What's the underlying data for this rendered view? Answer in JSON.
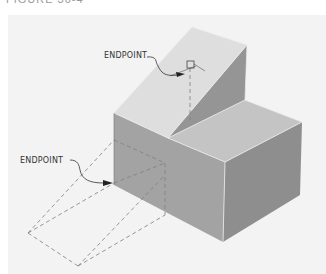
{
  "figure": {
    "caption": "FIGURE 30-4"
  },
  "annotations": [
    {
      "label": "ENDPOINT",
      "target": "wedge-top-edge-endpoint"
    },
    {
      "label": "ENDPOINT",
      "target": "block-front-edge-endpoint"
    }
  ],
  "colors": {
    "background": "#ffffff",
    "panel": "#f3f3f3",
    "top_face": "#c9c9c9",
    "wedge_slope": "#dcdcdc",
    "front_face": "#9c9c9c",
    "side_face": "#8f8f8f",
    "wedge_side": "#9a9a9a",
    "edge": "#e8e8e8",
    "dash": "#8a8a8a",
    "leader": "#333333"
  }
}
